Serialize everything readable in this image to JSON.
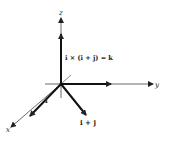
{
  "diagram": {
    "axes": {
      "x_label": "x",
      "y_label": "y",
      "z_label": "z"
    },
    "vectors": [
      {
        "name": "i",
        "label": "i"
      },
      {
        "name": "i+j",
        "label": "i + j"
      },
      {
        "name": "k",
        "label": "i × (i + j) = k"
      }
    ],
    "colors": {
      "axis": "#333333",
      "vector": "#111111"
    }
  }
}
